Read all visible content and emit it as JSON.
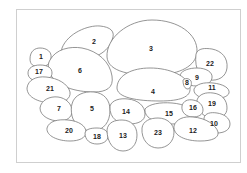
{
  "figure": {
    "type": "numbered key diagram",
    "line_color": "#7a7a7a",
    "frame_color": "#cfcfcf",
    "labels": [
      {
        "id": "1",
        "x": 41,
        "y": 57
      },
      {
        "id": "2",
        "x": 94,
        "y": 42
      },
      {
        "id": "3",
        "x": 151,
        "y": 49
      },
      {
        "id": "4",
        "x": 153,
        "y": 92
      },
      {
        "id": "5",
        "x": 92,
        "y": 109
      },
      {
        "id": "6",
        "x": 80,
        "y": 71
      },
      {
        "id": "7",
        "x": 59,
        "y": 109
      },
      {
        "id": "8",
        "x": 187,
        "y": 83
      },
      {
        "id": "9",
        "x": 197,
        "y": 78
      },
      {
        "id": "10",
        "x": 214,
        "y": 124
      },
      {
        "id": "11",
        "x": 212,
        "y": 88
      },
      {
        "id": "12",
        "x": 193,
        "y": 131
      },
      {
        "id": "13",
        "x": 123,
        "y": 136
      },
      {
        "id": "14",
        "x": 126,
        "y": 112
      },
      {
        "id": "15",
        "x": 169,
        "y": 114
      },
      {
        "id": "16",
        "x": 193,
        "y": 108
      },
      {
        "id": "17",
        "x": 39,
        "y": 72
      },
      {
        "id": "18",
        "x": 97,
        "y": 137
      },
      {
        "id": "19",
        "x": 212,
        "y": 104
      },
      {
        "id": "20",
        "x": 69,
        "y": 131
      },
      {
        "id": "21",
        "x": 50,
        "y": 89
      },
      {
        "id": "22",
        "x": 210,
        "y": 64
      },
      {
        "id": "23",
        "x": 158,
        "y": 133
      }
    ]
  }
}
